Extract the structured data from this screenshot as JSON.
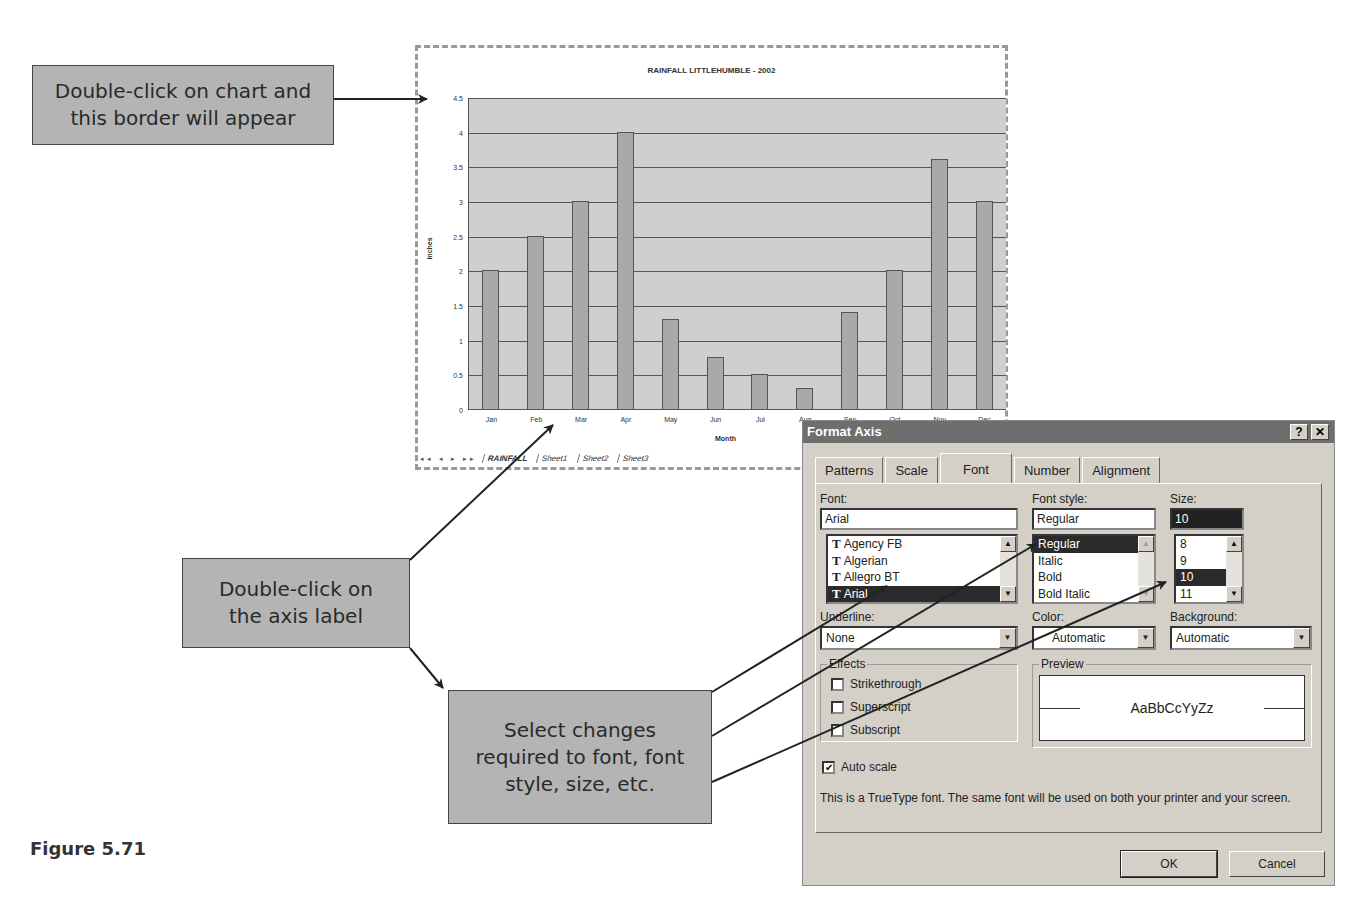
{
  "callouts": {
    "border": "Double-click on chart and\nthis border will appear",
    "axis_label": "Double-click on\nthe axis label",
    "select_changes": "Select changes\nrequired to font, font\nstyle, size, etc."
  },
  "figure_label": "Figure 5.71",
  "chart_window": {
    "sheet_nav": "◂◂ ◂ ▸ ▸▸",
    "sheet_tabs": [
      "RAINFALL",
      "Sheet1",
      "Sheet2",
      "Sheet3"
    ],
    "active_tab": "RAINFALL"
  },
  "chart_data": {
    "type": "bar",
    "title": "RAINFALL LITTLEHUMBLE - 2002",
    "xlabel": "Month",
    "ylabel": "Inches",
    "categories": [
      "Jan",
      "Feb",
      "Mar",
      "Apr",
      "May",
      "Jun",
      "Jul",
      "Aug",
      "Sep",
      "Oct",
      "Nov",
      "Dec"
    ],
    "values": [
      2,
      2.5,
      3,
      4,
      1.3,
      0.75,
      0.5,
      0.3,
      1.4,
      2,
      3.6,
      3
    ],
    "ylim": [
      0,
      4.5
    ],
    "yticks": [
      "0",
      "0.5",
      "1",
      "1.5",
      "2",
      "2.5",
      "3",
      "3.5",
      "4",
      "4.5"
    ],
    "grid": true,
    "legend": false
  },
  "dialog": {
    "title": "Format Axis",
    "help_btn": "?",
    "close_btn": "✕",
    "tabs": [
      "Patterns",
      "Scale",
      "Font",
      "Number",
      "Alignment"
    ],
    "active_tab": "Font",
    "font": {
      "label": "Font:",
      "value": "Arial",
      "options": [
        "Agency FB",
        "Algerian",
        "Allegro BT",
        "Arial"
      ],
      "selected": "Arial"
    },
    "font_style": {
      "label": "Font style:",
      "value": "Regular",
      "options": [
        "Regular",
        "Italic",
        "Bold",
        "Bold Italic"
      ],
      "selected": "Regular"
    },
    "size": {
      "label": "Size:",
      "value": "10",
      "options": [
        "8",
        "9",
        "10",
        "11"
      ],
      "selected": "10"
    },
    "underline": {
      "label": "Underline:",
      "value": "None"
    },
    "color": {
      "label": "Color:",
      "value": "Automatic"
    },
    "background": {
      "label": "Background:",
      "value": "Automatic"
    },
    "effects": {
      "title": "Effects",
      "strikethrough": {
        "label": "Strikethrough",
        "checked": false
      },
      "superscript": {
        "label": "Superscript",
        "checked": false
      },
      "subscript": {
        "label": "Subscript",
        "checked": false
      }
    },
    "preview": {
      "title": "Preview",
      "sample": "AaBbCcYyZz"
    },
    "auto_scale": {
      "label": "Auto scale",
      "checked": true,
      "mark": "✔"
    },
    "info_text": "This is a TrueType font.  The same font will be used on both your printer and your screen.",
    "ok_label": "OK",
    "cancel_label": "Cancel"
  }
}
